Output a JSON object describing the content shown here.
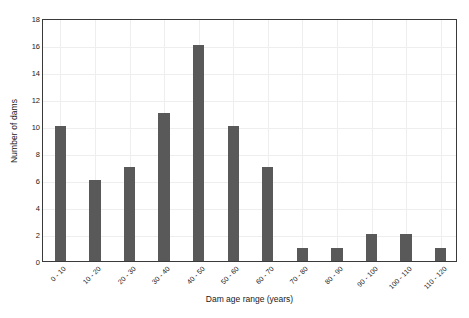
{
  "chart_data": {
    "type": "bar",
    "title": "",
    "xlabel": "Dam age range (years)",
    "ylabel": "Number of dams",
    "categories": [
      "0 - 10",
      "10 - 20",
      "20 - 30",
      "30 - 40",
      "40 - 50",
      "50 - 60",
      "60 - 70",
      "70 - 80",
      "80 - 90",
      "90 - 100",
      "100 - 110",
      "110 - 120"
    ],
    "values": [
      10,
      6,
      7,
      11,
      16,
      10,
      7,
      1,
      1,
      2,
      2,
      1
    ],
    "ylim": [
      0,
      18
    ],
    "yticks": [
      0,
      2,
      4,
      6,
      8,
      10,
      12,
      14,
      16,
      18
    ],
    "ytick_labels": [
      "0",
      "2",
      "4",
      "6",
      "8",
      "10",
      "12",
      "14",
      "16",
      "18"
    ],
    "grid": true,
    "legend": false,
    "bar_color": "#595959",
    "grid_color": "#eeeeee",
    "axis_color": "#3a3a3a",
    "xtick_rotation": -45
  }
}
